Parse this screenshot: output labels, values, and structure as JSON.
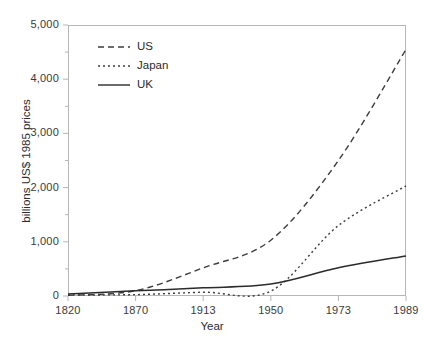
{
  "chart_data": {
    "type": "line",
    "title": "",
    "xlabel": "Year",
    "ylabel": "billions US$ 1985 prices",
    "categories": [
      "1820",
      "1870",
      "1913",
      "1950",
      "1973",
      "1989"
    ],
    "x_tick_labels": [
      "1820",
      "1870",
      "1913",
      "1950",
      "1973",
      "1989"
    ],
    "y_tick_labels": [
      "0",
      "1,000",
      "2,000",
      "3,000",
      "4,000",
      "5,000"
    ],
    "y_tick_values": [
      0,
      1000,
      2000,
      3000,
      4000,
      5000
    ],
    "ylim": [
      0,
      5000
    ],
    "y_minor_ticks": [
      500,
      1500,
      2500,
      3500,
      4500
    ],
    "grid": false,
    "legend_position": "top-left-inside",
    "axis_spacing": "categorical-equal",
    "series": [
      {
        "name": "US",
        "style": "dashed",
        "color": "#3c3c3c",
        "values": [
          12,
          98,
          520,
          1030,
          2500,
          4550
        ]
      },
      {
        "name": "Japan",
        "style": "dotted",
        "color": "#3c3c3c",
        "values": [
          20,
          25,
          70,
          90,
          1300,
          2030
        ]
      },
      {
        "name": "UK",
        "style": "solid",
        "color": "#2b2b2b",
        "values": [
          35,
          95,
          150,
          220,
          520,
          740
        ]
      }
    ]
  },
  "legend": {
    "entries": [
      {
        "label": "US",
        "style": "dashed"
      },
      {
        "label": "Japan",
        "style": "dotted"
      },
      {
        "label": "UK",
        "style": "solid"
      }
    ]
  },
  "colors": {
    "frame": "#b6b6b6",
    "tick": "#b6b6b6",
    "line": "#3c3c3c",
    "text": "#2b2b2b",
    "background": "#ffffff"
  }
}
